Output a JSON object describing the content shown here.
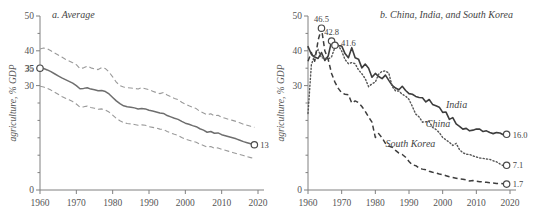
{
  "figure": {
    "width": 545,
    "height": 220,
    "background": "#ffffff",
    "line_color": "#3d3d3d",
    "band_color": "#9a9a9a",
    "axis_color": "#808080"
  },
  "chart_data": [
    {
      "type": "line",
      "panel_id": "a",
      "title": "a. Average",
      "xlabel": "",
      "ylabel": "agriculture, % GDP",
      "xlim": [
        1960,
        2020
      ],
      "ylim": [
        0,
        50
      ],
      "xticks": [
        1960,
        1970,
        1980,
        1990,
        2000,
        2010,
        2020
      ],
      "xticklabels": [
        "1960",
        "1970",
        "1980",
        "1990",
        "2000",
        "2010",
        "2020"
      ],
      "yticks": [
        0,
        5,
        10,
        15,
        20,
        25,
        30,
        35,
        40,
        45,
        50
      ],
      "yticklabels_shown": [
        "0",
        "30",
        "35",
        "40",
        "50"
      ],
      "grid": false,
      "legend": "none",
      "annotations": [
        {
          "text": "35",
          "x": 1960,
          "y": 35,
          "marker": true
        },
        {
          "text": "13",
          "x": 2019,
          "y": 13,
          "marker": true
        }
      ],
      "series": [
        {
          "name": "Average",
          "style": "solid",
          "x": [
            1960,
            1961,
            1962,
            1963,
            1964,
            1965,
            1966,
            1967,
            1968,
            1969,
            1970,
            1971,
            1972,
            1973,
            1974,
            1975,
            1976,
            1977,
            1978,
            1979,
            1980,
            1981,
            1982,
            1983,
            1984,
            1985,
            1986,
            1987,
            1988,
            1989,
            1990,
            1991,
            1992,
            1993,
            1994,
            1995,
            1996,
            1997,
            1998,
            1999,
            2000,
            2001,
            2002,
            2003,
            2004,
            2005,
            2006,
            2007,
            2008,
            2009,
            2010,
            2011,
            2012,
            2013,
            2014,
            2015,
            2016,
            2017,
            2018,
            2019
          ],
          "values": [
            35.0,
            34.9,
            34.5,
            34.0,
            33.4,
            32.8,
            32.2,
            31.7,
            31.2,
            30.7,
            30.0,
            29.1,
            29.2,
            29.4,
            29.0,
            28.8,
            28.5,
            28.6,
            28.3,
            27.6,
            26.6,
            25.6,
            24.8,
            24.2,
            23.9,
            23.8,
            23.6,
            23.3,
            23.4,
            23.3,
            22.9,
            22.7,
            22.4,
            22.1,
            22.0,
            21.4,
            21.0,
            20.6,
            20.3,
            19.7,
            19.2,
            18.9,
            18.5,
            18.2,
            17.6,
            17.2,
            16.6,
            16.8,
            16.3,
            16.4,
            15.9,
            15.6,
            15.3,
            15.0,
            14.7,
            14.3,
            13.9,
            13.6,
            13.3,
            13.0
          ]
        },
        {
          "name": "Upper band",
          "style": "dashed",
          "x": [
            1960,
            1961,
            1962,
            1963,
            1964,
            1965,
            1966,
            1967,
            1968,
            1969,
            1970,
            1971,
            1972,
            1973,
            1974,
            1975,
            1976,
            1977,
            1978,
            1979,
            1980,
            1981,
            1982,
            1983,
            1984,
            1985,
            1986,
            1987,
            1988,
            1989,
            1990,
            1991,
            1992,
            1993,
            1994,
            1995,
            1996,
            1997,
            1998,
            1999,
            2000,
            2001,
            2002,
            2003,
            2004,
            2005,
            2006,
            2007,
            2008,
            2009,
            2010,
            2011,
            2012,
            2013,
            2014,
            2015,
            2016,
            2017,
            2018,
            2019
          ],
          "values": [
            40.5,
            40.8,
            40.6,
            40.0,
            39.4,
            38.8,
            38.2,
            37.6,
            37.1,
            36.6,
            36.0,
            34.9,
            35.1,
            35.6,
            35.1,
            34.8,
            34.6,
            35.2,
            34.9,
            33.9,
            32.5,
            31.0,
            30.0,
            29.6,
            29.4,
            29.3,
            29.2,
            29.0,
            29.4,
            29.1,
            28.8,
            28.4,
            28.0,
            27.7,
            28.0,
            27.3,
            26.8,
            26.3,
            26.0,
            25.2,
            24.7,
            24.2,
            23.8,
            23.4,
            22.6,
            22.1,
            21.6,
            21.9,
            21.3,
            21.5,
            20.9,
            20.6,
            20.3,
            20.0,
            19.7,
            19.3,
            18.9,
            18.6,
            18.3,
            18.0
          ]
        },
        {
          "name": "Lower band",
          "style": "dashed",
          "x": [
            1960,
            1961,
            1962,
            1963,
            1964,
            1965,
            1966,
            1967,
            1968,
            1969,
            1970,
            1971,
            1972,
            1973,
            1974,
            1975,
            1976,
            1977,
            1978,
            1979,
            1980,
            1981,
            1982,
            1983,
            1984,
            1985,
            1986,
            1987,
            1988,
            1989,
            1990,
            1991,
            1992,
            1993,
            1994,
            1995,
            1996,
            1997,
            1998,
            1999,
            2000,
            2001,
            2002,
            2003,
            2004,
            2005,
            2006,
            2007,
            2008,
            2009,
            2010,
            2011,
            2012,
            2013,
            2014,
            2015,
            2016,
            2017,
            2018,
            2019
          ],
          "values": [
            29.8,
            29.6,
            29.2,
            28.7,
            28.1,
            27.5,
            26.9,
            26.4,
            25.9,
            25.4,
            24.7,
            23.8,
            23.9,
            24.1,
            23.7,
            23.5,
            23.2,
            23.3,
            23.0,
            22.4,
            21.5,
            20.6,
            19.9,
            19.4,
            19.1,
            19.0,
            18.8,
            18.6,
            18.7,
            18.6,
            18.2,
            18.0,
            17.8,
            17.5,
            17.4,
            16.8,
            16.4,
            16.0,
            15.7,
            15.1,
            14.6,
            14.3,
            14.0,
            13.7,
            13.2,
            12.8,
            12.3,
            12.5,
            12.0,
            12.1,
            11.7,
            11.4,
            11.1,
            10.8,
            10.5,
            10.2,
            9.9,
            9.6,
            9.3,
            9.0
          ]
        }
      ]
    },
    {
      "type": "line",
      "panel_id": "b",
      "title": "b. China, India, and South Korea",
      "xlabel": "",
      "ylabel": "agriculture, % GDP",
      "xlim": [
        1960,
        2020
      ],
      "ylim": [
        0,
        50
      ],
      "xticks": [
        1960,
        1970,
        1980,
        1990,
        2000,
        2010,
        2020
      ],
      "xticklabels": [
        "1960",
        "1970",
        "1980",
        "1990",
        "2000",
        "2010",
        "2020"
      ],
      "yticks": [
        0,
        5,
        10,
        15,
        20,
        25,
        30,
        35,
        40,
        45,
        50
      ],
      "yticklabels_shown": [
        "0",
        "30",
        "40",
        "50"
      ],
      "grid": false,
      "legend": "inline-labels",
      "annotations": [
        {
          "text": "46.5",
          "x": 1964,
          "y": 46.5,
          "marker": true,
          "series": "South Korea"
        },
        {
          "text": "42.8",
          "x": 1967,
          "y": 42.8,
          "marker": true,
          "series": "India"
        },
        {
          "text": "41.6",
          "x": 1968,
          "y": 41.6,
          "marker": true,
          "series": "China"
        },
        {
          "text": "16.0",
          "x": 2019,
          "y": 16.0,
          "marker": true,
          "series": "India"
        },
        {
          "text": "7.1",
          "x": 2019,
          "y": 7.1,
          "marker": true,
          "series": "China"
        },
        {
          "text": "1.7",
          "x": 2019,
          "y": 1.7,
          "marker": true,
          "series": "South Korea"
        }
      ],
      "inline_labels": [
        {
          "text": "India",
          "x": 2001,
          "y": 23.5
        },
        {
          "text": "China",
          "x": 1995,
          "y": 18.0
        },
        {
          "text": "South Korea",
          "x": 1983,
          "y": 12.5
        }
      ],
      "series": [
        {
          "name": "India",
          "style": "solid",
          "x": [
            1960,
            1961,
            1962,
            1963,
            1964,
            1965,
            1966,
            1967,
            1968,
            1969,
            1970,
            1971,
            1972,
            1973,
            1974,
            1975,
            1976,
            1977,
            1978,
            1979,
            1980,
            1981,
            1982,
            1983,
            1984,
            1985,
            1986,
            1987,
            1988,
            1989,
            1990,
            1991,
            1992,
            1993,
            1994,
            1995,
            1996,
            1997,
            1998,
            1999,
            2000,
            2001,
            2002,
            2003,
            2004,
            2005,
            2006,
            2007,
            2008,
            2009,
            2010,
            2011,
            2012,
            2013,
            2014,
            2015,
            2016,
            2017,
            2018,
            2019
          ],
          "values": [
            41.2,
            39.0,
            38.2,
            37.8,
            39.5,
            37.2,
            38.5,
            42.8,
            41.8,
            41.5,
            41.4,
            39.2,
            38.0,
            40.9,
            38.0,
            37.6,
            35.1,
            36.2,
            35.0,
            32.4,
            33.5,
            32.6,
            32.0,
            33.0,
            31.5,
            30.1,
            29.3,
            28.8,
            29.8,
            28.6,
            27.7,
            27.5,
            26.9,
            26.6,
            26.5,
            25.3,
            26.0,
            24.6,
            24.2,
            23.8,
            22.3,
            22.4,
            20.3,
            20.8,
            19.0,
            18.3,
            17.5,
            17.7,
            17.0,
            17.2,
            17.5,
            17.5,
            16.8,
            17.0,
            16.5,
            16.2,
            16.5,
            16.4,
            15.9,
            16.0
          ]
        },
        {
          "name": "China",
          "style": "dotted",
          "x": [
            1960,
            1961,
            1962,
            1963,
            1964,
            1965,
            1966,
            1967,
            1968,
            1969,
            1970,
            1971,
            1972,
            1973,
            1974,
            1975,
            1976,
            1977,
            1978,
            1979,
            1980,
            1981,
            1982,
            1983,
            1984,
            1985,
            1986,
            1987,
            1988,
            1989,
            1990,
            1991,
            1992,
            1993,
            1994,
            1995,
            1996,
            1997,
            1998,
            1999,
            2000,
            2001,
            2002,
            2003,
            2004,
            2005,
            2006,
            2007,
            2008,
            2009,
            2010,
            2011,
            2012,
            2013,
            2014,
            2015,
            2016,
            2017,
            2018,
            2019
          ],
          "values": [
            22.0,
            36.0,
            38.8,
            40.3,
            38.0,
            37.9,
            37.6,
            38.3,
            41.0,
            41.6,
            39.9,
            37.5,
            36.3,
            36.6,
            36.3,
            34.5,
            33.4,
            32.0,
            29.7,
            30.5,
            31.0,
            33.3,
            34.1,
            34.2,
            33.6,
            29.8,
            28.5,
            28.4,
            27.5,
            27.0,
            26.0,
            24.0,
            21.8,
            21.0,
            19.5,
            19.6,
            19.7,
            18.0,
            17.4,
            16.5,
            15.1,
            14.4,
            13.7,
            12.8,
            13.4,
            11.6,
            10.7,
            10.3,
            10.2,
            9.8,
            9.5,
            9.2,
            9.1,
            8.9,
            8.8,
            8.4,
            8.1,
            7.5,
            7.0,
            7.1
          ]
        },
        {
          "name": "South Korea",
          "style": "dashed",
          "x": [
            1960,
            1961,
            1962,
            1963,
            1964,
            1965,
            1966,
            1967,
            1968,
            1969,
            1970,
            1971,
            1972,
            1973,
            1974,
            1975,
            1976,
            1977,
            1978,
            1979,
            1980,
            1981,
            1982,
            1983,
            1984,
            1985,
            1986,
            1987,
            1988,
            1989,
            1990,
            1991,
            1992,
            1993,
            1994,
            1995,
            1996,
            1997,
            1998,
            1999,
            2000,
            2001,
            2002,
            2003,
            2004,
            2005,
            2006,
            2007,
            2008,
            2009,
            2010,
            2011,
            2012,
            2013,
            2014,
            2015,
            2016,
            2017,
            2018,
            2019
          ],
          "values": [
            37.0,
            39.5,
            37.0,
            43.0,
            46.5,
            40.0,
            37.5,
            33.5,
            31.0,
            29.2,
            27.9,
            27.5,
            27.4,
            25.0,
            25.6,
            25.1,
            24.0,
            22.6,
            21.0,
            19.5,
            15.1,
            16.2,
            15.0,
            13.4,
            12.6,
            12.3,
            11.4,
            10.6,
            10.2,
            9.4,
            8.2,
            7.2,
            7.0,
            6.3,
            6.0,
            5.8,
            5.4,
            5.1,
            4.9,
            4.6,
            4.4,
            4.1,
            3.8,
            3.6,
            3.4,
            3.2,
            3.1,
            2.9,
            2.6,
            2.7,
            2.5,
            2.4,
            2.3,
            2.2,
            2.1,
            2.0,
            1.9,
            1.9,
            1.8,
            1.7
          ]
        }
      ]
    }
  ]
}
